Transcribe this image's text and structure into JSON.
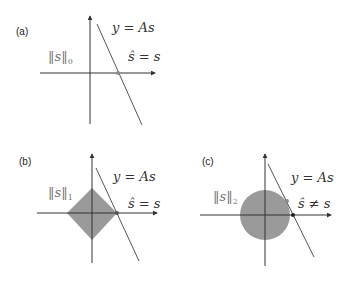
{
  "colors": {
    "axis": "#333333",
    "line": "#555555",
    "shape_fill": "#9a9a9a",
    "dot_gray": "#8a8a8a",
    "dot_black": "#222222",
    "norm_text": "#777777"
  },
  "panels": [
    {
      "id": "a",
      "label": "(a)",
      "norm_label": "‖s‖",
      "norm_sub": "0",
      "line_label": "y = As",
      "solution_label": "ŝ = s",
      "shape": "none"
    },
    {
      "id": "b",
      "label": "(b)",
      "norm_label": "‖s‖",
      "norm_sub": "1",
      "line_label": "y = As",
      "solution_label": "ŝ = s",
      "shape": "diamond"
    },
    {
      "id": "c",
      "label": "(c)",
      "norm_label": "‖s‖",
      "norm_sub": "2",
      "line_label": "y = As",
      "solution_label": "ŝ ≠ s",
      "shape": "circle"
    }
  ]
}
